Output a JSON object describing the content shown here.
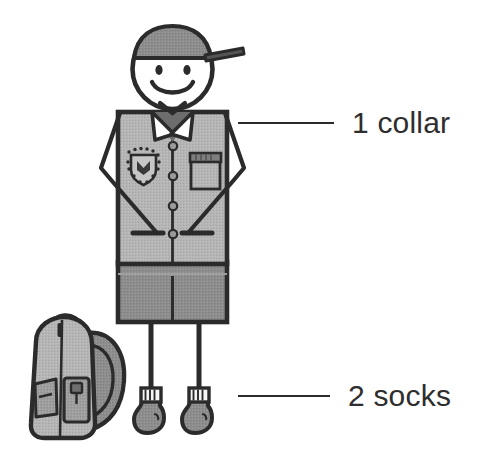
{
  "diagram": {
    "background_color": "#ffffff",
    "ink_color": "#2b2b2b",
    "text_color": "#2e2e2e"
  },
  "palette": {
    "outline": "#2b2b2b",
    "shirt_fill": "#b3b3b3",
    "shorts_fill": "#8c8c8c",
    "cap_fill": "#8f8f8f",
    "collar_fill": "#ffffff",
    "face_fill": "#ffffff",
    "pocket_flap_fill": "#7e7e7e",
    "sock_cuff_fill": "#f2f2f2",
    "sock_foot_fill": "#8c8c8c",
    "backpack_body_fill": "#b3b3b3",
    "backpack_strap_fill": "#8c8c8c",
    "backpack_pocket_fill": "#9c9c9c"
  },
  "callouts": [
    {
      "id": "collar",
      "label": "1 collar",
      "count": 1,
      "part": "collar",
      "leader_line": true,
      "points_to": "shirt-collar"
    },
    {
      "id": "socks",
      "label": "2 socks",
      "count": 2,
      "part": "socks",
      "leader_line": true,
      "points_to": "socks"
    }
  ],
  "figure_parts": [
    {
      "name": "cap",
      "label": "cap"
    },
    {
      "name": "head",
      "label": "head"
    },
    {
      "name": "face-smile",
      "label": "smiling face"
    },
    {
      "name": "collar",
      "label": "collar"
    },
    {
      "name": "shirt",
      "label": "shirt"
    },
    {
      "name": "school-badge",
      "label": "school badge"
    },
    {
      "name": "shirt-pocket",
      "label": "shirt pocket"
    },
    {
      "name": "shirt-buttons",
      "label": "buttons",
      "count": 4
    },
    {
      "name": "arms",
      "label": "arms",
      "count": 2
    },
    {
      "name": "shorts",
      "label": "shorts"
    },
    {
      "name": "legs",
      "label": "legs",
      "count": 2
    },
    {
      "name": "socks",
      "label": "socks",
      "count": 2
    },
    {
      "name": "backpack",
      "label": "backpack"
    }
  ]
}
